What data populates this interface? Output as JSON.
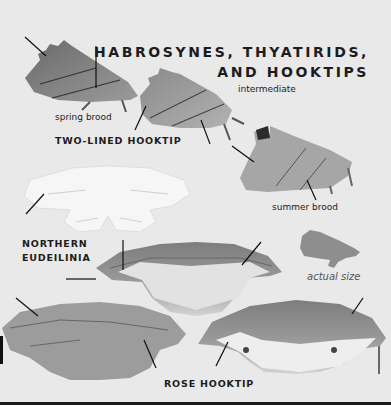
{
  "title": {
    "line1": "HABROSYNES, THYATIRIDS,",
    "line2": "AND HOOKTIPS"
  },
  "species": [
    {
      "name": "TWO-LINED HOOKTIP",
      "broods": [
        "spring brood",
        "intermediate",
        "summer brood"
      ]
    },
    {
      "name_line1": "NORTHERN",
      "name_line2": "EUDEILINIA"
    },
    {
      "name": "ROSE HOOKTIP"
    }
  ],
  "size_note": "actual size",
  "colors": {
    "background": "#e9e9e9",
    "text": "#1c1c1c",
    "silhouette": "#8e8e8e",
    "rule": "#1a1a1a"
  }
}
